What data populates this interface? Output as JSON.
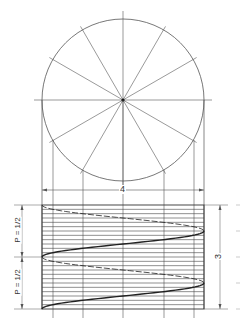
{
  "diagram": {
    "circle": {
      "cx": 123,
      "cy": 100,
      "r": 81,
      "divisions": 12
    },
    "elevation": {
      "x": 42,
      "y": 205,
      "width": 162,
      "height": 104,
      "horizontal_divisions": 24
    },
    "projection_x": [
      53,
      83,
      123,
      164,
      194
    ],
    "dimensions": {
      "width_label": "4",
      "height_label": "3",
      "pitch_labels": [
        "P = 1/2",
        "P = 1/2"
      ]
    },
    "colors": {
      "line": "#555555",
      "curve": "#222222",
      "background": "#ffffff"
    }
  }
}
